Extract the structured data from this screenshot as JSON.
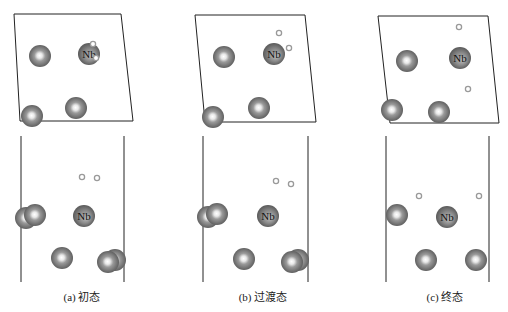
{
  "figure": {
    "panels": [
      {
        "id": "a",
        "caption": "(a) 初态",
        "caption_x": 82,
        "top_cell": [
          [
            14,
            14
          ],
          [
            121,
            14
          ],
          [
            133,
            121
          ],
          [
            20,
            121
          ]
        ],
        "top_atoms": [
          {
            "x": 40,
            "y": 56,
            "r": 11,
            "label": ""
          },
          {
            "x": 89,
            "y": 54,
            "r": 11,
            "label": "Nb"
          },
          {
            "x": 32,
            "y": 116,
            "r": 11,
            "label": ""
          },
          {
            "x": 76,
            "y": 108,
            "r": 11,
            "label": ""
          }
        ],
        "top_small": [
          {
            "x": 93,
            "y": 44
          },
          {
            "x": 96,
            "y": 58
          }
        ],
        "side_lines": [
          {
            "x": 21,
            "y1": 136,
            "y2": 282
          },
          {
            "x": 124,
            "y1": 136,
            "y2": 282
          }
        ],
        "side_atoms": [
          {
            "x": 26,
            "y": 218,
            "r": 11,
            "label": ""
          },
          {
            "x": 35,
            "y": 215,
            "r": 11,
            "label": ""
          },
          {
            "x": 84,
            "y": 216,
            "r": 11,
            "label": "Nb"
          },
          {
            "x": 62,
            "y": 258,
            "r": 11,
            "label": ""
          },
          {
            "x": 115,
            "y": 260,
            "r": 11,
            "label": ""
          },
          {
            "x": 108,
            "y": 262,
            "r": 11,
            "label": ""
          }
        ],
        "side_small": [
          {
            "x": 82,
            "y": 177
          },
          {
            "x": 97,
            "y": 178
          }
        ]
      },
      {
        "id": "b",
        "caption": "(b) 过渡态",
        "caption_x": 263,
        "top_cell": [
          [
            195,
            15
          ],
          [
            305,
            15
          ],
          [
            316,
            122
          ],
          [
            205,
            122
          ]
        ],
        "top_atoms": [
          {
            "x": 224,
            "y": 57,
            "r": 11,
            "label": ""
          },
          {
            "x": 274,
            "y": 54,
            "r": 11,
            "label": "Nb"
          },
          {
            "x": 213,
            "y": 117,
            "r": 11,
            "label": ""
          },
          {
            "x": 259,
            "y": 108,
            "r": 11,
            "label": ""
          }
        ],
        "top_small": [
          {
            "x": 279,
            "y": 33
          },
          {
            "x": 289,
            "y": 48
          }
        ],
        "side_lines": [
          {
            "x": 203,
            "y1": 136,
            "y2": 282
          },
          {
            "x": 308,
            "y1": 136,
            "y2": 282
          }
        ],
        "side_atoms": [
          {
            "x": 208,
            "y": 217,
            "r": 11,
            "label": ""
          },
          {
            "x": 217,
            "y": 214,
            "r": 11,
            "label": ""
          },
          {
            "x": 268,
            "y": 216,
            "r": 11,
            "label": "Nb"
          },
          {
            "x": 244,
            "y": 259,
            "r": 11,
            "label": ""
          },
          {
            "x": 298,
            "y": 260,
            "r": 11,
            "label": ""
          },
          {
            "x": 292,
            "y": 262,
            "r": 11,
            "label": ""
          }
        ],
        "side_small": [
          {
            "x": 276,
            "y": 181
          },
          {
            "x": 291,
            "y": 184
          }
        ]
      },
      {
        "id": "c",
        "caption": "(c) 终态",
        "caption_x": 445,
        "top_cell": [
          [
            378,
            16
          ],
          [
            488,
            16
          ],
          [
            499,
            123
          ],
          [
            390,
            123
          ]
        ],
        "top_atoms": [
          {
            "x": 407,
            "y": 61,
            "r": 11,
            "label": ""
          },
          {
            "x": 460,
            "y": 58,
            "r": 11,
            "label": "Nb"
          },
          {
            "x": 392,
            "y": 110,
            "r": 11,
            "label": ""
          },
          {
            "x": 439,
            "y": 112,
            "r": 11,
            "label": ""
          }
        ],
        "top_small": [
          {
            "x": 459,
            "y": 27
          },
          {
            "x": 468,
            "y": 89
          }
        ],
        "side_lines": [
          {
            "x": 386,
            "y1": 136,
            "y2": 282
          },
          {
            "x": 489,
            "y1": 136,
            "y2": 282
          }
        ],
        "side_atoms": [
          {
            "x": 397,
            "y": 215,
            "r": 11,
            "label": ""
          },
          {
            "x": 447,
            "y": 217,
            "r": 11,
            "label": "Nb"
          },
          {
            "x": 426,
            "y": 260,
            "r": 11,
            "label": ""
          },
          {
            "x": 476,
            "y": 260,
            "r": 11,
            "label": ""
          }
        ],
        "side_small": [
          {
            "x": 419,
            "y": 196
          },
          {
            "x": 479,
            "y": 196
          }
        ]
      }
    ],
    "colors": {
      "atom_dark": "#5a5a5a",
      "atom_mid": "#8a8a8a",
      "atom_light": "#ffffff",
      "small_atom_stroke": "#9a9a9a",
      "cell_line": "#222222"
    }
  }
}
